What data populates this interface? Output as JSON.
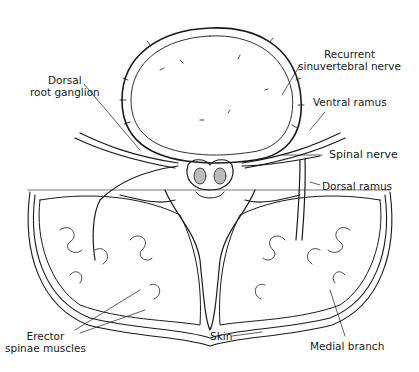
{
  "figure": {
    "labels": {
      "recurrent_line1": "Recurrent",
      "recurrent_line2": "sinuvertebral nerve",
      "dorsal_root_line1": "Dorsal",
      "dorsal_root_line2": "root ganglion",
      "ventral_ramus": "Ventral ramus",
      "spinal_nerve": "Spinal nerve",
      "dorsal_ramus": "Dorsal ramus",
      "erector_line1": "Erector",
      "erector_line2": "spinae muscles",
      "skin": "Skin",
      "medial_branch": "Medial branch"
    },
    "colors": {
      "ink": "#1a1a1a",
      "background": "#ffffff"
    }
  }
}
